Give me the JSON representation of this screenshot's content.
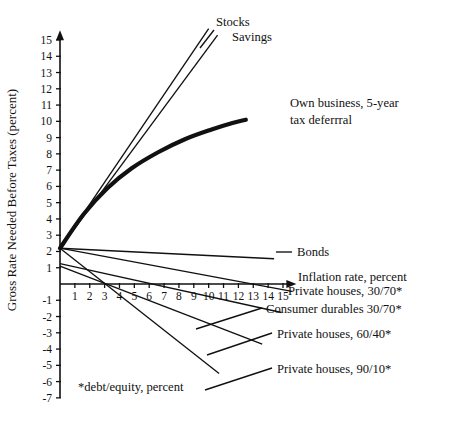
{
  "chart_data": {
    "type": "line",
    "title": "",
    "xlabel": "Inflation rate, percent",
    "ylabel": "Gross Rate Needed Before Taxes (percent)",
    "xlim": [
      0,
      15.9
    ],
    "ylim": [
      -7,
      15.6
    ],
    "grid": false,
    "legend_position": "inline-right-labels",
    "xticks": [
      "1",
      "2",
      "3",
      "4",
      "5",
      "6",
      "7",
      "8",
      "9",
      "10",
      "11",
      "12",
      "13",
      "14",
      "15"
    ],
    "xtick_values": [
      1,
      2,
      3,
      4,
      5,
      6,
      7,
      8,
      9,
      10,
      11,
      12,
      13,
      14,
      15
    ],
    "yticks": [
      "15",
      "14",
      "13",
      "12",
      "11",
      "10",
      "9",
      "8",
      "7",
      "6",
      "5",
      "4",
      "3",
      "2",
      "1",
      "-1",
      "-2",
      "-3",
      "-4",
      "-5",
      "-6",
      "-7"
    ],
    "ytick_values": [
      15,
      14,
      13,
      12,
      11,
      10,
      9,
      8,
      7,
      6,
      5,
      4,
      3,
      2,
      1,
      -1,
      -2,
      -3,
      -4,
      -5,
      -6,
      -7
    ],
    "footnote": "*debt/equity, percent",
    "series": [
      {
        "name": "Stocks",
        "style": "thin",
        "label": "Stocks",
        "label_x": 216,
        "label_y": 26,
        "points": [
          [
            0,
            2.2
          ],
          [
            10.0,
            15.7
          ]
        ]
      },
      {
        "name": "Savings",
        "style": "thin",
        "label": "Savings",
        "label_x": 232,
        "label_y": 41,
        "points": [
          [
            0,
            2.2
          ],
          [
            10.6,
            15.3
          ]
        ]
      },
      {
        "name": "Own business, 5-year tax deferrral",
        "style": "thick",
        "label_line1": "Own business, 5-year",
        "label_line2": "tax deferrral",
        "label_x": 290,
        "label_y": 107,
        "points": [
          [
            0,
            2.2
          ],
          [
            1.6,
            4.3
          ],
          [
            3.2,
            5.9
          ],
          [
            4.8,
            7.1
          ],
          [
            6.6,
            8.1
          ],
          [
            8.4,
            8.9
          ],
          [
            10.2,
            9.5
          ],
          [
            11.6,
            9.9
          ],
          [
            12.5,
            10.1
          ]
        ]
      },
      {
        "name": "Bonds",
        "style": "thin",
        "label": "Bonds",
        "label_x": 297,
        "label_y": 256,
        "points": [
          [
            0,
            2.2
          ],
          [
            14.4,
            1.55
          ]
        ]
      },
      {
        "name": "Private houses, 30/70*",
        "style": "thin",
        "label": "Private houses, 30/70*",
        "label_x": 288,
        "label_y": 295,
        "points": [
          [
            0,
            2.2
          ],
          [
            15.6,
            -0.45
          ]
        ]
      },
      {
        "name": "Consumer durables 30/70*",
        "style": "thin",
        "label": "Consumer durables 30/70*",
        "label_x": 266,
        "label_y": 313,
        "points": [
          [
            0,
            1.25
          ],
          [
            14.9,
            -1.75
          ]
        ]
      },
      {
        "name": "Private houses, 60/40*",
        "style": "thin",
        "label": "Private houses, 60/40*",
        "label_x": 277,
        "label_y": 338,
        "points": [
          [
            0,
            1.1
          ],
          [
            13.6,
            -3.7
          ]
        ]
      },
      {
        "name": "Private houses, 90/10*",
        "style": "thin",
        "label": "Private houses, 90/10*",
        "label_x": 277,
        "label_y": 373,
        "points": [
          [
            0,
            2.2
          ],
          [
            10.7,
            -5.5
          ]
        ]
      }
    ],
    "leaders": [
      {
        "name": "leader-stocks",
        "x1": 214,
        "y1": 30,
        "x2": 200,
        "y2": 48
      },
      {
        "name": "leader-bonds",
        "x1": 276,
        "y1": 252,
        "x2": 292,
        "y2": 252
      },
      {
        "name": "leader-consumer-durables",
        "x1": 196,
        "y1": 329,
        "x2": 262,
        "y2": 308
      },
      {
        "name": "leader-private-60-40",
        "x1": 207,
        "y1": 355,
        "x2": 272,
        "y2": 333
      },
      {
        "name": "leader-private-90-10",
        "x1": 205,
        "y1": 390,
        "x2": 272,
        "y2": 368
      }
    ]
  }
}
